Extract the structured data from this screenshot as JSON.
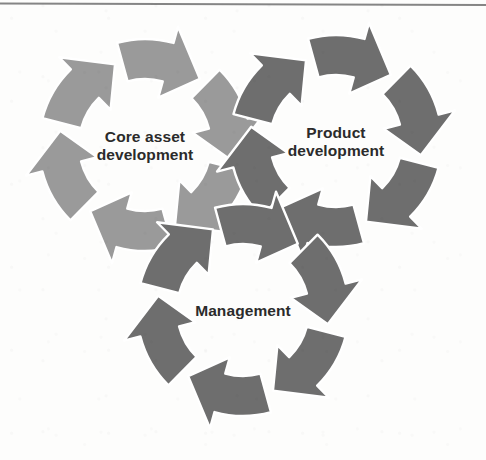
{
  "figure": {
    "background_color": "#fdfdfc",
    "label_color": "#2b2b2b",
    "arrow_outline_color": "#ffffff",
    "segments_per_cycle": 6,
    "rotation_direction": "clockwise",
    "scan_line": {
      "color": "#5a5a5a",
      "y": 3,
      "height": 2
    }
  },
  "cycles": [
    {
      "id": "core-asset-development",
      "label_line1": "Core asset",
      "label_line2": "development",
      "color": "#9a9a9a",
      "cx": 145,
      "cy": 145,
      "outer_radius": 106,
      "inner_radius": 66,
      "z": 1
    },
    {
      "id": "product-development",
      "label_line1": "Product",
      "label_line2": "development",
      "color": "#6e6e6e",
      "cx": 336,
      "cy": 141,
      "outer_radius": 106,
      "inner_radius": 66,
      "z": 2
    },
    {
      "id": "management",
      "label_line1": "Management",
      "label_line2": "",
      "color": "#6e6e6e",
      "cx": 243,
      "cy": 310,
      "outer_radius": 106,
      "inner_radius": 66,
      "z": 3
    }
  ]
}
